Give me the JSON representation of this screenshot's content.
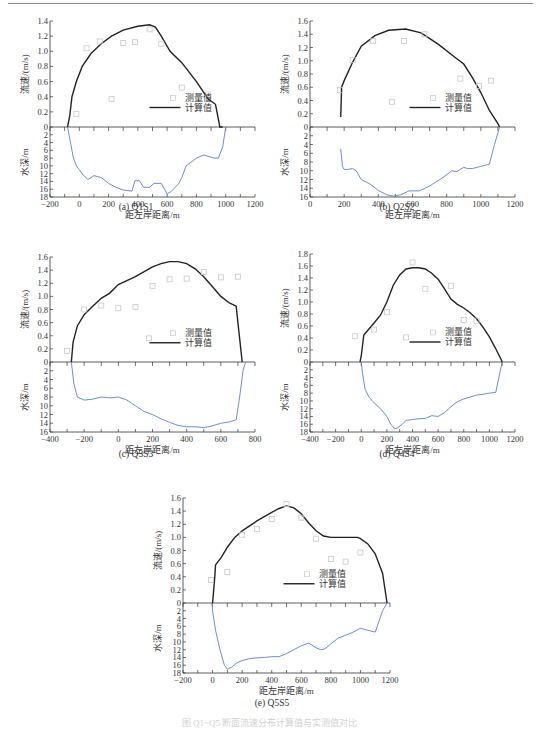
{
  "labels": {
    "velocity_axis": "流速/(m/s)",
    "depth_axis": "水深/m",
    "distance_axis": "距左岸距离/m",
    "legend_measured": "测量值",
    "legend_computed": "计算值"
  },
  "captions": {
    "a": "(a) Q1S1",
    "b": "(b) Q2S2",
    "c": "(c) Q3S3",
    "d": "(d) Q4S4",
    "e": "(e) Q5S5"
  },
  "colors": {
    "computed_line": "#222222",
    "depth_line": "#5b7fd0",
    "measured_marker": "#c8c8c8",
    "axis": "#333333"
  },
  "chart_data": [
    {
      "id": "a",
      "type": "line",
      "title": "(a) Q1S1",
      "xlabel": "距左岸距离/m",
      "ylabel": "流速/(m/s)",
      "ylabel2": "水深/m",
      "xlim": [
        -200,
        1200
      ],
      "xticks": [
        -200,
        0,
        200,
        400,
        600,
        800,
        1000,
        1200
      ],
      "ylim_velocity": [
        0,
        1.4
      ],
      "yticks_velocity": [
        0,
        0.2,
        0.4,
        0.6,
        0.8,
        1.0,
        1.2,
        1.4
      ],
      "ylim_depth": [
        0,
        18
      ],
      "yticks_depth": [
        2,
        4,
        6,
        8,
        10,
        12,
        14,
        16,
        18
      ],
      "legend": [
        "测量值",
        "计算值"
      ],
      "legend_position": "center-lower",
      "series": [
        {
          "name": "计算值",
          "x": [
            -80,
            -65,
            -50,
            -20,
            20,
            80,
            150,
            220,
            300,
            400,
            480,
            520,
            560,
            620,
            700,
            800,
            880,
            930,
            950,
            960,
            980
          ],
          "y": [
            0,
            0.15,
            0.4,
            0.6,
            0.8,
            0.97,
            1.1,
            1.2,
            1.28,
            1.33,
            1.35,
            1.32,
            1.2,
            1.0,
            0.85,
            0.6,
            0.37,
            0.3,
            0.1,
            0,
            0
          ]
        },
        {
          "name": "测量值",
          "x": [
            -20,
            50,
            140,
            220,
            300,
            380,
            480,
            560,
            700,
            880
          ],
          "y": [
            0.17,
            1.04,
            1.13,
            0.37,
            1.11,
            1.12,
            1.29,
            1.1,
            0.52,
            0.43
          ]
        },
        {
          "name": "水深",
          "x": [
            -80,
            -60,
            -40,
            -20,
            0,
            30,
            60,
            100,
            150,
            200,
            250,
            300,
            360,
            380,
            410,
            440,
            480,
            510,
            560,
            600,
            630,
            680,
            700,
            730,
            800,
            850,
            920,
            950,
            980,
            1000
          ],
          "y": [
            0,
            4,
            8,
            10,
            11,
            12.5,
            13.5,
            12.5,
            13,
            14.5,
            15.5,
            16.2,
            16.5,
            13.8,
            13.8,
            15.5,
            15.5,
            14.5,
            14.5,
            17.2,
            16.5,
            14.5,
            13,
            10,
            8,
            7.2,
            8,
            8,
            5,
            0
          ]
        }
      ]
    },
    {
      "id": "b",
      "type": "line",
      "title": "(b) Q2S2",
      "xlabel": "距左岸距离/m",
      "ylabel": "流速/(m/s)",
      "ylabel2": "水深/m",
      "xlim": [
        0,
        1200
      ],
      "xticks": [
        0,
        200,
        400,
        600,
        800,
        1000,
        1200
      ],
      "ylim_velocity": [
        0,
        1.6
      ],
      "yticks_velocity": [
        0,
        0.2,
        0.4,
        0.6,
        0.8,
        1.0,
        1.2,
        1.4,
        1.6
      ],
      "ylim_depth": [
        0,
        16
      ],
      "yticks_depth": [
        2,
        4,
        6,
        8,
        10,
        12,
        14,
        16
      ],
      "legend": [
        "测量值",
        "计算值"
      ],
      "legend_position": "center-lower",
      "series": [
        {
          "name": "计算值",
          "x": [
            180,
            185,
            200,
            250,
            300,
            380,
            460,
            560,
            650,
            750,
            850,
            900,
            950,
            1000,
            1050,
            1100,
            1110
          ],
          "y": [
            0.15,
            0.6,
            0.7,
            0.98,
            1.22,
            1.38,
            1.46,
            1.48,
            1.42,
            1.25,
            1.05,
            0.95,
            0.75,
            0.52,
            0.25,
            0.05,
            0
          ]
        },
        {
          "name": "测量值",
          "x": [
            175,
            250,
            370,
            480,
            550,
            670,
            880,
            990,
            1060
          ],
          "y": [
            0.56,
            1.01,
            1.3,
            0.38,
            1.3,
            1.4,
            0.73,
            0.62,
            0.7
          ]
        },
        {
          "name": "水深",
          "x": [
            180,
            190,
            200,
            220,
            250,
            270,
            300,
            350,
            400,
            450,
            490,
            530,
            580,
            640,
            700,
            780,
            830,
            860,
            900,
            920,
            950,
            1000,
            1050,
            1080,
            1110
          ],
          "y": [
            5,
            9,
            9.7,
            9.7,
            9.5,
            10,
            12,
            13,
            14.5,
            15.5,
            15.8,
            15.5,
            14.6,
            14.6,
            13.5,
            11.5,
            10,
            10.2,
            9.2,
            9.5,
            9.5,
            9,
            8.5,
            4,
            0
          ]
        }
      ]
    },
    {
      "id": "c",
      "type": "line",
      "title": "(c) Q3S3",
      "xlabel": "距左岸距离/m",
      "ylabel": "流速/(m/s)",
      "ylabel2": "水深/m",
      "xlim": [
        -400,
        800
      ],
      "xticks": [
        -400,
        -200,
        0,
        200,
        400,
        600,
        800
      ],
      "ylim_velocity": [
        0,
        1.6
      ],
      "yticks_velocity": [
        0,
        0.2,
        0.4,
        0.6,
        0.8,
        1.0,
        1.2,
        1.4,
        1.6
      ],
      "ylim_depth": [
        0,
        16
      ],
      "yticks_depth": [
        2,
        4,
        6,
        8,
        10,
        12,
        14,
        16
      ],
      "legend": [
        "测量值",
        "计算值"
      ],
      "legend_position": "center-lower",
      "series": [
        {
          "name": "计算值",
          "x": [
            -275,
            -265,
            -240,
            -200,
            -150,
            -100,
            -50,
            0,
            100,
            200,
            250,
            300,
            350,
            400,
            450,
            500,
            550,
            600,
            650,
            690,
            700,
            725
          ],
          "y": [
            0,
            0.3,
            0.55,
            0.72,
            0.85,
            0.97,
            1.05,
            1.18,
            1.3,
            1.45,
            1.5,
            1.53,
            1.53,
            1.5,
            1.42,
            1.3,
            1.15,
            1.0,
            0.9,
            0.85,
            0.6,
            0
          ]
        },
        {
          "name": "测量值",
          "x": [
            -300,
            -200,
            -100,
            0,
            100,
            180,
            200,
            300,
            400,
            500,
            600,
            700
          ],
          "y": [
            0.17,
            0.8,
            0.86,
            0.82,
            0.84,
            0.36,
            1.16,
            1.26,
            1.27,
            1.37,
            1.29,
            1.3
          ]
        },
        {
          "name": "水深",
          "x": [
            -275,
            -260,
            -240,
            -200,
            -150,
            -100,
            -50,
            0,
            50,
            100,
            150,
            200,
            250,
            300,
            350,
            400,
            450,
            500,
            550,
            600,
            650,
            690,
            710,
            730,
            745
          ],
          "y": [
            0,
            5,
            8,
            8.7,
            8.5,
            8.0,
            8.2,
            8.0,
            8.7,
            10,
            11.3,
            12,
            13,
            13.8,
            14.5,
            14.8,
            14.8,
            15.0,
            14.6,
            14.0,
            13.7,
            13.2,
            8,
            2,
            0
          ]
        }
      ]
    },
    {
      "id": "d",
      "type": "line",
      "title": "(d) Q4S4",
      "xlabel": "距左岸距离/m",
      "ylabel": "流速/(m/s)",
      "ylabel2": "水深/m",
      "xlim": [
        -400,
        1200
      ],
      "xticks": [
        -400,
        -200,
        0,
        200,
        400,
        600,
        800,
        1000,
        1200
      ],
      "ylim_velocity": [
        0,
        1.8
      ],
      "yticks_velocity": [
        0,
        0.2,
        0.4,
        0.6,
        0.8,
        1.0,
        1.2,
        1.4,
        1.6,
        1.8
      ],
      "ylim_depth": [
        0,
        18
      ],
      "yticks_depth": [
        2,
        4,
        6,
        8,
        10,
        12,
        14,
        16,
        18
      ],
      "legend": [
        "测量值",
        "计算值"
      ],
      "legend_position": "center-lower",
      "series": [
        {
          "name": "计算值",
          "x": [
            -10,
            0,
            20,
            60,
            100,
            150,
            200,
            250,
            300,
            350,
            400,
            450,
            500,
            550,
            600,
            650,
            700,
            750,
            800,
            850,
            900,
            950,
            1000,
            1050,
            1090,
            1100
          ],
          "y": [
            0,
            0.1,
            0.45,
            0.55,
            0.65,
            0.78,
            1.0,
            1.28,
            1.45,
            1.55,
            1.57,
            1.57,
            1.55,
            1.48,
            1.38,
            1.22,
            1.05,
            0.96,
            0.9,
            0.82,
            0.72,
            0.58,
            0.42,
            0.22,
            0.05,
            0
          ]
        },
        {
          "name": "测量值",
          "x": [
            -50,
            100,
            200,
            350,
            400,
            500,
            700,
            800,
            900
          ],
          "y": [
            0.43,
            0.54,
            0.83,
            0.41,
            1.66,
            1.22,
            1.27,
            0.7,
            0.69
          ]
        },
        {
          "name": "水深",
          "x": [
            0,
            10,
            30,
            60,
            100,
            150,
            200,
            230,
            260,
            280,
            320,
            350,
            400,
            450,
            500,
            550,
            600,
            650,
            700,
            750,
            800,
            850,
            900,
            950,
            1000,
            1050,
            1080,
            1100
          ],
          "y": [
            0,
            3,
            7,
            9,
            10.5,
            12,
            14,
            16,
            17.2,
            17,
            16,
            15,
            14.8,
            14.6,
            14.5,
            13.8,
            14,
            13,
            11.5,
            10.2,
            9.5,
            9,
            8.5,
            8.3,
            8,
            7.8,
            3,
            0
          ]
        }
      ]
    },
    {
      "id": "e",
      "type": "line",
      "title": "(e) Q5S5",
      "xlabel": "距左岸距离/m",
      "ylabel": "流速/(m/s)",
      "ylabel2": "水深/m",
      "xlim": [
        -200,
        1200
      ],
      "xticks": [
        -200,
        0,
        200,
        400,
        600,
        800,
        1000,
        1200
      ],
      "ylim_velocity": [
        0,
        1.6
      ],
      "yticks_velocity": [
        0,
        0.2,
        0.4,
        0.6,
        0.8,
        1.0,
        1.2,
        1.4,
        1.6
      ],
      "ylim_depth": [
        0,
        18
      ],
      "yticks_depth": [
        2,
        4,
        6,
        8,
        10,
        12,
        14,
        16,
        18
      ],
      "legend": [
        "测量值",
        "计算值"
      ],
      "legend_position": "center-lower",
      "series": [
        {
          "name": "计算值",
          "x": [
            0,
            15,
            20,
            60,
            100,
            150,
            200,
            300,
            400,
            450,
            500,
            550,
            600,
            650,
            700,
            750,
            800,
            900,
            980,
            1000,
            1050,
            1100,
            1150,
            1180
          ],
          "y": [
            0,
            0.4,
            0.58,
            0.7,
            0.85,
            1.0,
            1.1,
            1.25,
            1.38,
            1.44,
            1.48,
            1.45,
            1.36,
            1.22,
            1.1,
            1.02,
            1.0,
            1.0,
            1.0,
            0.98,
            0.9,
            0.75,
            0.45,
            0
          ]
        },
        {
          "name": "测量值",
          "x": [
            -10,
            100,
            200,
            300,
            400,
            500,
            600,
            700,
            800,
            900,
            1000
          ],
          "y": [
            0.35,
            0.47,
            1.04,
            1.13,
            1.28,
            1.51,
            1.3,
            0.98,
            0.67,
            0.63,
            0.77
          ]
        },
        {
          "name": "水深",
          "x": [
            -5,
            0,
            20,
            50,
            80,
            100,
            130,
            160,
            200,
            250,
            300,
            350,
            400,
            450,
            500,
            550,
            600,
            650,
            700,
            730,
            760,
            800,
            850,
            900,
            950,
            1000,
            1050,
            1100,
            1150,
            1180
          ],
          "y": [
            0,
            2,
            7,
            12,
            16,
            17,
            16.5,
            15.5,
            14.8,
            14.3,
            14.1,
            14,
            13.8,
            13.8,
            13,
            12,
            11,
            10.3,
            11.5,
            12,
            11.8,
            10.5,
            9,
            8.3,
            7.5,
            6.5,
            7,
            7.5,
            2,
            0
          ]
        }
      ]
    }
  ],
  "layout": [
    {
      "id": "a",
      "left": 50,
      "right": 255,
      "v_top": 21,
      "zero": 127,
      "d_bottom": 197,
      "cap_x": 136,
      "cap_y": 208
    },
    {
      "id": "b",
      "left": 310,
      "right": 515,
      "v_top": 21,
      "zero": 127,
      "d_bottom": 197,
      "cap_x": 397,
      "cap_y": 208
    },
    {
      "id": "c",
      "left": 50,
      "right": 255,
      "v_top": 257,
      "zero": 362,
      "d_bottom": 432,
      "cap_x": 136,
      "cap_y": 456
    },
    {
      "id": "d",
      "left": 310,
      "right": 515,
      "v_top": 254,
      "zero": 362,
      "d_bottom": 432,
      "cap_x": 397,
      "cap_y": 456
    },
    {
      "id": "e",
      "left": 183,
      "right": 390,
      "v_top": 498,
      "zero": 603,
      "d_bottom": 673,
      "cap_x": 272,
      "cap_y": 704
    }
  ],
  "figure_caption": "图 Q1~Q5 断面流速分布计算值与实测值对比"
}
